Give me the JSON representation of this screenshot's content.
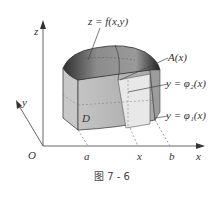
{
  "figure": {
    "caption": "图 7 - 6",
    "axes": {
      "z_label": "z",
      "y_label": "y",
      "x_label": "x",
      "origin_label": "O"
    },
    "labels": {
      "surface": "z = f(x,y)",
      "cross_section": "A(x)",
      "upper_curve": "y = φ₂(x)",
      "lower_curve": "y = φ₁(x)",
      "region": "D",
      "a_tick": "a",
      "x_tick": "x",
      "b_tick": "b"
    },
    "colors": {
      "axis": "#555555",
      "solid_side": "#b5b5b5",
      "solid_top": "#8a8a8a",
      "solid_dark": "#3a3a3a",
      "cross_section": "#e6e6e6",
      "text": "#333333"
    }
  }
}
